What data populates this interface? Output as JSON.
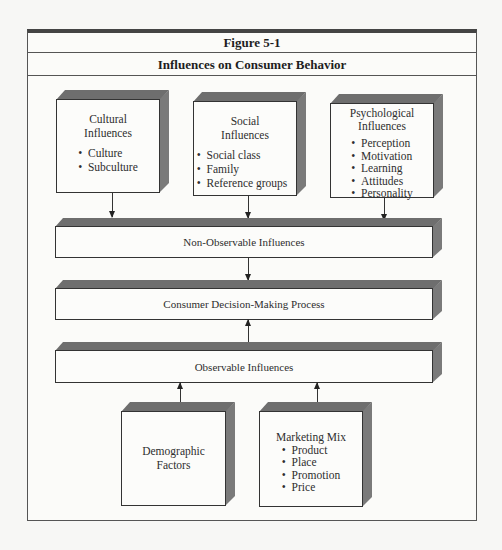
{
  "figure": {
    "label": "Figure 5-1",
    "title": "Influences on Consumer Behavior"
  },
  "top_boxes": [
    {
      "heading_line1": "Cultural",
      "heading_line2": "Influences",
      "items": [
        "Culture",
        "Subculture"
      ]
    },
    {
      "heading_line1": "Social",
      "heading_line2": "Influences",
      "items": [
        "Social class",
        "Family",
        "Reference groups"
      ]
    },
    {
      "heading_line1": "Psychological",
      "heading_line2": "Influences",
      "items": [
        "Perception",
        "Motivation",
        "Learning",
        "Attitudes",
        "Personality"
      ]
    }
  ],
  "bars": [
    {
      "label": "Non-Observable Influences"
    },
    {
      "label": "Consumer Decision-Making Process"
    },
    {
      "label": "Observable Influences"
    }
  ],
  "bottom_boxes": [
    {
      "heading_line1": "Demographic",
      "heading_line2": "Factors",
      "items": []
    },
    {
      "heading_line1": "Marketing Mix",
      "heading_line2": "",
      "items": [
        "Product",
        "Place",
        "Promotion",
        "Price"
      ]
    }
  ],
  "colors": {
    "box_shadow": "#6e6e6e",
    "border": "#333333",
    "background": "#fbfbf9"
  }
}
